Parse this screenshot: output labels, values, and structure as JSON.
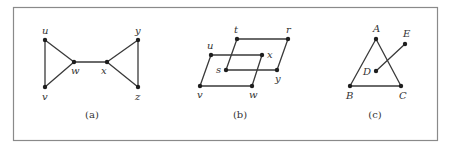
{
  "figure": {
    "panels": [
      {
        "id": "a",
        "caption": "(a)",
        "nodes": [
          {
            "label": "u",
            "x": 45,
            "y": 40,
            "lx": 42,
            "ly": 34
          },
          {
            "label": "v",
            "x": 45,
            "y": 87,
            "lx": 42,
            "ly": 100
          },
          {
            "label": "w",
            "x": 74,
            "y": 62,
            "lx": 71,
            "ly": 74
          },
          {
            "label": "x",
            "x": 107,
            "y": 62,
            "lx": 101,
            "ly": 74
          },
          {
            "label": "y",
            "x": 138,
            "y": 40,
            "lx": 135,
            "ly": 34
          },
          {
            "label": "z",
            "x": 138,
            "y": 87,
            "lx": 135,
            "ly": 100
          }
        ],
        "edges": [
          [
            "u",
            "v"
          ],
          [
            "u",
            "w"
          ],
          [
            "v",
            "w"
          ],
          [
            "w",
            "x"
          ],
          [
            "x",
            "y"
          ],
          [
            "x",
            "z"
          ],
          [
            "y",
            "z"
          ]
        ],
        "caption_pos": {
          "x": 92,
          "y": 118
        }
      },
      {
        "id": "b",
        "caption": "(b)",
        "nodes": [
          {
            "label": "t",
            "x": 237,
            "y": 39,
            "lx": 234,
            "ly": 33
          },
          {
            "label": "r",
            "x": 288,
            "y": 39,
            "lx": 286,
            "ly": 33
          },
          {
            "label": "u",
            "x": 211,
            "y": 55,
            "lx": 207,
            "ly": 49
          },
          {
            "label": "x",
            "x": 262,
            "y": 55,
            "lx": 267,
            "ly": 58
          },
          {
            "label": "s",
            "x": 226,
            "y": 70,
            "lx": 216,
            "ly": 73
          },
          {
            "label": "y",
            "x": 277,
            "y": 70,
            "lx": 275,
            "ly": 82
          },
          {
            "label": "v",
            "x": 200,
            "y": 86,
            "lx": 197,
            "ly": 98
          },
          {
            "label": "w",
            "x": 252,
            "y": 86,
            "lx": 249,
            "ly": 98
          }
        ],
        "edges": [
          [
            "t",
            "r"
          ],
          [
            "r",
            "y"
          ],
          [
            "y",
            "s"
          ],
          [
            "s",
            "t"
          ],
          [
            "u",
            "x"
          ],
          [
            "x",
            "w"
          ],
          [
            "w",
            "v"
          ],
          [
            "v",
            "u"
          ]
        ],
        "caption_pos": {
          "x": 240,
          "y": 118
        }
      },
      {
        "id": "c",
        "caption": "(c)",
        "nodes": [
          {
            "label": "A",
            "x": 376,
            "y": 39,
            "lx": 373,
            "ly": 32
          },
          {
            "label": "E",
            "x": 405,
            "y": 44,
            "lx": 403,
            "ly": 37
          },
          {
            "label": "D",
            "x": 376,
            "y": 71,
            "lx": 363,
            "ly": 75
          },
          {
            "label": "B",
            "x": 350,
            "y": 86,
            "lx": 346,
            "ly": 99
          },
          {
            "label": "C",
            "x": 401,
            "y": 86,
            "lx": 399,
            "ly": 99
          }
        ],
        "edges": [
          [
            "A",
            "B"
          ],
          [
            "B",
            "C"
          ],
          [
            "C",
            "A"
          ],
          [
            "D",
            "E"
          ]
        ],
        "caption_pos": {
          "x": 375,
          "y": 118
        }
      }
    ]
  },
  "colors": {
    "frame": "#8a8a8a",
    "edge": "#3a3a3a",
    "node": "#1e1e1e",
    "text": "#333333"
  }
}
